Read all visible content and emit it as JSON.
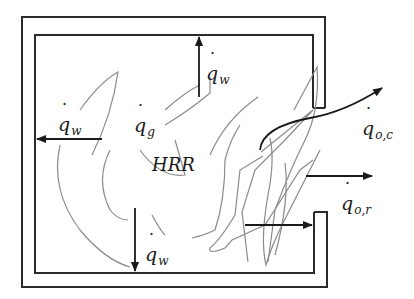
{
  "diagram": {
    "colors": {
      "wall": "#2a2a2a",
      "arrow": "#1a1a1a",
      "flame": "#8a8a8a",
      "background": "#ffffff"
    },
    "labels": {
      "q_w_top": {
        "base": "q",
        "sub": "w"
      },
      "q_w_left": {
        "base": "q",
        "sub": "w"
      },
      "q_w_bottom": {
        "base": "q",
        "sub": "w"
      },
      "q_g": {
        "base": "q",
        "sub": "g"
      },
      "q_oc": {
        "base": "q",
        "sub": "o,c"
      },
      "q_or": {
        "base": "q",
        "sub": "o,r"
      },
      "hrr": "HRR"
    },
    "nodes": [
      {
        "id": "compartment",
        "type": "enclosure-with-opening",
        "opening_side": "right"
      },
      {
        "id": "fire",
        "label": "HRR"
      }
    ],
    "edges": [
      {
        "from": "fire",
        "to": "ceiling",
        "label": "q̇_w",
        "direction": "up"
      },
      {
        "from": "fire",
        "to": "left-wall",
        "label": "q̇_w",
        "direction": "left"
      },
      {
        "from": "fire",
        "to": "floor",
        "label": "q̇_w",
        "direction": "down"
      },
      {
        "from": "fire",
        "to": "gas",
        "label": "q̇_g"
      },
      {
        "from": "fire",
        "to": "opening",
        "label": "q̇_o,c",
        "kind": "convective",
        "direction": "out-curved"
      },
      {
        "from": "fire",
        "to": "opening",
        "label": "q̇_o,r",
        "kind": "radiative",
        "direction": "right"
      }
    ]
  }
}
